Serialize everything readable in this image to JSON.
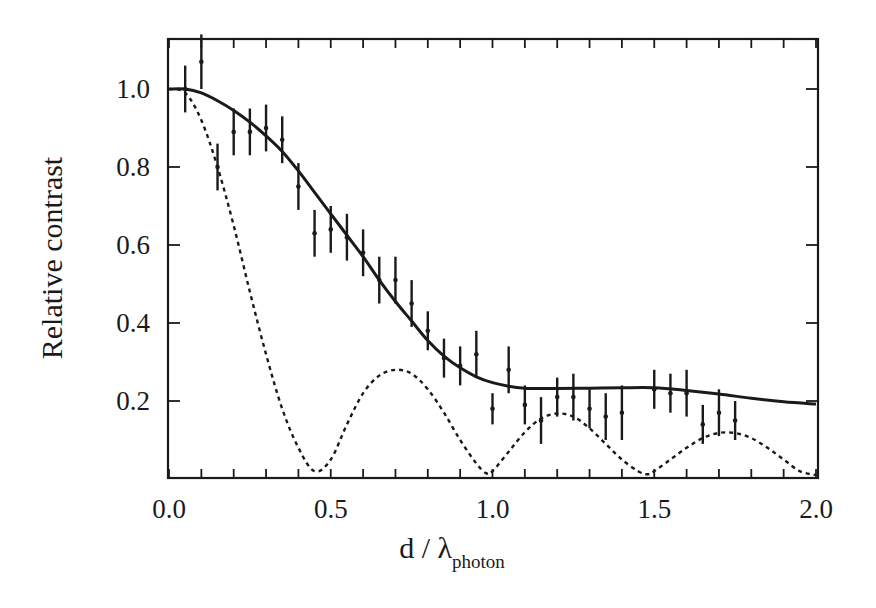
{
  "chart_data": {
    "type": "line",
    "title": "",
    "xlabel": "d / λ_photon",
    "xlabel_main": "d / λ",
    "xlabel_sub": "photon",
    "ylabel": "Relative contrast",
    "xlim": [
      0.0,
      2.0
    ],
    "ylim": [
      0.0,
      1.12
    ],
    "x_ticks": [
      "0.0",
      "0.5",
      "1.0",
      "1.5",
      "2.0"
    ],
    "y_ticks": [
      "0.2",
      "0.4",
      "0.6",
      "0.8",
      "1.0"
    ],
    "grid": false,
    "legend": "none",
    "series": [
      {
        "name": "measured data",
        "style": "points with vertical error bars",
        "points": [
          {
            "x": 0.05,
            "y": 1.0,
            "err": 0.06
          },
          {
            "x": 0.1,
            "y": 1.07,
            "err": 0.07
          },
          {
            "x": 0.15,
            "y": 0.8,
            "err": 0.06
          },
          {
            "x": 0.2,
            "y": 0.89,
            "err": 0.06
          },
          {
            "x": 0.25,
            "y": 0.89,
            "err": 0.06
          },
          {
            "x": 0.3,
            "y": 0.9,
            "err": 0.06
          },
          {
            "x": 0.35,
            "y": 0.87,
            "err": 0.06
          },
          {
            "x": 0.4,
            "y": 0.75,
            "err": 0.06
          },
          {
            "x": 0.45,
            "y": 0.63,
            "err": 0.06
          },
          {
            "x": 0.5,
            "y": 0.64,
            "err": 0.06
          },
          {
            "x": 0.55,
            "y": 0.62,
            "err": 0.06
          },
          {
            "x": 0.6,
            "y": 0.58,
            "err": 0.06
          },
          {
            "x": 0.65,
            "y": 0.51,
            "err": 0.06
          },
          {
            "x": 0.7,
            "y": 0.51,
            "err": 0.06
          },
          {
            "x": 0.75,
            "y": 0.45,
            "err": 0.06
          },
          {
            "x": 0.8,
            "y": 0.38,
            "err": 0.05
          },
          {
            "x": 0.85,
            "y": 0.31,
            "err": 0.05
          },
          {
            "x": 0.9,
            "y": 0.29,
            "err": 0.05
          },
          {
            "x": 0.95,
            "y": 0.32,
            "err": 0.06
          },
          {
            "x": 1.0,
            "y": 0.18,
            "err": 0.04
          },
          {
            "x": 1.05,
            "y": 0.28,
            "err": 0.06
          },
          {
            "x": 1.1,
            "y": 0.19,
            "err": 0.05
          },
          {
            "x": 1.15,
            "y": 0.15,
            "err": 0.06
          },
          {
            "x": 1.2,
            "y": 0.21,
            "err": 0.05
          },
          {
            "x": 1.25,
            "y": 0.21,
            "err": 0.06
          },
          {
            "x": 1.3,
            "y": 0.18,
            "err": 0.05
          },
          {
            "x": 1.35,
            "y": 0.16,
            "err": 0.06
          },
          {
            "x": 1.4,
            "y": 0.17,
            "err": 0.07
          },
          {
            "x": 1.5,
            "y": 0.23,
            "err": 0.05
          },
          {
            "x": 1.55,
            "y": 0.22,
            "err": 0.05
          },
          {
            "x": 1.6,
            "y": 0.22,
            "err": 0.06
          },
          {
            "x": 1.65,
            "y": 0.14,
            "err": 0.05
          },
          {
            "x": 1.7,
            "y": 0.17,
            "err": 0.06
          },
          {
            "x": 1.75,
            "y": 0.15,
            "err": 0.05
          }
        ]
      },
      {
        "name": "solid fit curve",
        "style": "solid",
        "x": [
          0.0,
          0.05,
          0.1,
          0.15,
          0.2,
          0.25,
          0.3,
          0.35,
          0.4,
          0.45,
          0.5,
          0.55,
          0.6,
          0.65,
          0.7,
          0.75,
          0.8,
          0.85,
          0.9,
          0.95,
          1.0,
          1.05,
          1.1,
          1.15,
          1.2,
          1.3,
          1.4,
          1.5,
          1.6,
          1.7,
          1.8,
          1.9,
          2.0
        ],
        "y": [
          1.0,
          1.0,
          0.99,
          0.97,
          0.945,
          0.915,
          0.88,
          0.84,
          0.79,
          0.735,
          0.68,
          0.625,
          0.57,
          0.51,
          0.455,
          0.405,
          0.355,
          0.315,
          0.285,
          0.262,
          0.247,
          0.238,
          0.233,
          0.232,
          0.232,
          0.233,
          0.234,
          0.234,
          0.227,
          0.218,
          0.207,
          0.198,
          0.192
        ]
      },
      {
        "name": "dashed curve",
        "style": "dashed",
        "x": [
          0.0,
          0.05,
          0.1,
          0.15,
          0.2,
          0.25,
          0.3,
          0.35,
          0.4,
          0.45,
          0.5,
          0.55,
          0.6,
          0.65,
          0.7,
          0.75,
          0.8,
          0.85,
          0.9,
          0.95,
          0.98,
          1.0,
          1.05,
          1.1,
          1.15,
          1.2,
          1.25,
          1.3,
          1.35,
          1.4,
          1.45,
          1.48,
          1.5,
          1.55,
          1.6,
          1.65,
          1.7,
          1.75,
          1.8,
          1.85,
          1.9,
          1.95,
          2.0
        ],
        "y": [
          1.0,
          0.99,
          0.92,
          0.8,
          0.65,
          0.48,
          0.32,
          0.18,
          0.08,
          0.02,
          0.05,
          0.14,
          0.22,
          0.265,
          0.28,
          0.27,
          0.23,
          0.17,
          0.1,
          0.04,
          0.015,
          0.02,
          0.07,
          0.12,
          0.155,
          0.168,
          0.16,
          0.13,
          0.09,
          0.05,
          0.02,
          0.012,
          0.02,
          0.05,
          0.08,
          0.105,
          0.118,
          0.118,
          0.105,
          0.08,
          0.05,
          0.02,
          0.01
        ]
      }
    ]
  },
  "colors": {
    "background": "#ffffff",
    "ink": "#1a1a1a"
  }
}
